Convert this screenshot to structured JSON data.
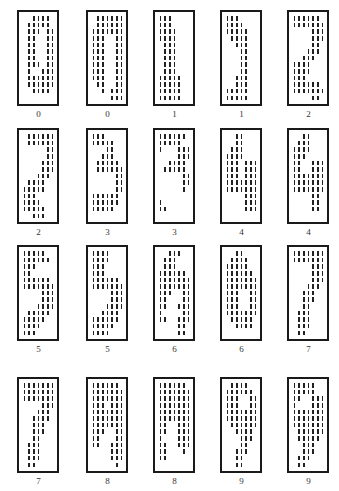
{
  "figure": {
    "grid_columns": 7,
    "grid_rows": 13,
    "samples": [
      {
        "label": "0",
        "bitmap": [
          "0011110",
          "0111110",
          "0111011",
          "0110011",
          "0110011",
          "0110011",
          "0110011",
          "0111011",
          "0100111",
          "0111111",
          "0111111",
          "0011110",
          "0000000"
        ]
      },
      {
        "label": "0",
        "bitmap": [
          "0111111",
          "0111111",
          "1111111",
          "1110011",
          "1110011",
          "1110011",
          "1110011",
          "1110011",
          "1110011",
          "1110011",
          "0110011",
          "0010111",
          "0000111"
        ]
      },
      {
        "label": "1",
        "bitmap": [
          "1110000",
          "1110000",
          "1111000",
          "1111000",
          "0111000",
          "0111000",
          "0111000",
          "0111000",
          "0111000",
          "1111100",
          "1111100",
          "1111100",
          "1111100"
        ]
      },
      {
        "label": "1",
        "bitmap": [
          "1110000",
          "1111000",
          "1111100",
          "0111100",
          "0011100",
          "0001100",
          "0001100",
          "0001100",
          "0001100",
          "0011100",
          "0011100",
          "1111100",
          "1111100"
        ]
      },
      {
        "label": "2",
        "bitmap": [
          "1111110",
          "1111111",
          "0000111",
          "0000111",
          "0000110",
          "0001110",
          "0011100",
          "1111000",
          "1111000",
          "1110000",
          "1111110",
          "1111111",
          "0000110"
        ]
      },
      {
        "label": "2",
        "bitmap": [
          "0111111",
          "0111111",
          "0000011",
          "0000011",
          "0000111",
          "0000111",
          "0001110",
          "0111100",
          "1111100",
          "1110000",
          "1111000",
          "1111100",
          "0011100"
        ]
      },
      {
        "label": "3",
        "bitmap": [
          "1110000",
          "1111100",
          "0001100",
          "0011100",
          "0111110",
          "0111111",
          "0000011",
          "0000011",
          "0000011",
          "1111110",
          "1111110",
          "1111100",
          "0000000"
        ]
      },
      {
        "label": "3",
        "bitmap": [
          "1111110",
          "1111100",
          "1000111",
          "0000111",
          "0011110",
          "0111110",
          "0000011",
          "0000011",
          "0000010",
          "0000000",
          "1000000",
          "1100000",
          "0000000"
        ]
      },
      {
        "label": "4",
        "bitmap": [
          "0011000",
          "0011000",
          "0111000",
          "1111000",
          "1110111",
          "1110111",
          "1110111",
          "1111111",
          "1111111",
          "0000111",
          "0000111",
          "0000111",
          "0000000"
        ]
      },
      {
        "label": "4",
        "bitmap": [
          "0011000",
          "0111000",
          "1111000",
          "1110000",
          "1100111",
          "1100111",
          "1111111",
          "1111111",
          "1111111",
          "0000110",
          "0000110",
          "0000110",
          "0000000"
        ]
      },
      {
        "label": "5",
        "bitmap": [
          "1111100",
          "1111110",
          "1110000",
          "1100000",
          "1111110",
          "1111111",
          "0000111",
          "0000111",
          "0001111",
          "0111110",
          "1111100",
          "1111000",
          "1110000"
        ]
      },
      {
        "label": "5",
        "bitmap": [
          "1111000",
          "1111000",
          "1110000",
          "1110000",
          "1111110",
          "1111111",
          "0000111",
          "0000111",
          "0001111",
          "0011110",
          "1111110",
          "1111100",
          "1111000"
        ]
      },
      {
        "label": "6",
        "bitmap": [
          "0011100",
          "0111000",
          "0111000",
          "1111110",
          "1111111",
          "1111111",
          "1110011",
          "1100011",
          "1100111",
          "1000011",
          "1100111",
          "0000110",
          "0000110"
        ]
      },
      {
        "label": "6",
        "bitmap": [
          "0011000",
          "0111100",
          "1111100",
          "1111110",
          "1111111",
          "1111111",
          "1110011",
          "1110011",
          "1110011",
          "1111111",
          "0111110",
          "0011110",
          "0000000"
        ]
      },
      {
        "label": "7",
        "bitmap": [
          "1111111",
          "1111111",
          "0000111",
          "0000111",
          "0000111",
          "0001110",
          "0011100",
          "0011100",
          "0011000",
          "0111000",
          "0111000",
          "0111000",
          "0110000"
        ]
      },
      {
        "label": "7",
        "bitmap": [
          "1111111",
          "1111111",
          "1111111",
          "0000111",
          "0001110",
          "0011110",
          "0011100",
          "0011100",
          "0011000",
          "0111000",
          "0111000",
          "0111000",
          "0110000"
        ]
      },
      {
        "label": "8",
        "bitmap": [
          "1111110",
          "1111111",
          "1111111",
          "1110111",
          "1111111",
          "1111111",
          "1111111",
          "1110011",
          "1100011",
          "1100111",
          "0000111",
          "0000111",
          "0000010"
        ]
      },
      {
        "label": "8",
        "bitmap": [
          "1111110",
          "1111111",
          "1111111",
          "1111111",
          "1111111",
          "1111111",
          "1100111",
          "1100111",
          "1000111",
          "1100111",
          "1100010",
          "1100000",
          "0000000"
        ]
      },
      {
        "label": "9",
        "bitmap": [
          "0111100",
          "1111110",
          "1110011",
          "1110011",
          "1111111",
          "1111111",
          "0111111",
          "0011110",
          "0001110",
          "0001100",
          "0011100",
          "0011000",
          "0011000"
        ]
      },
      {
        "label": "9",
        "bitmap": [
          "1111100",
          "1111100",
          "1100111",
          "1000111",
          "1111111",
          "1111111",
          "1111111",
          "0111111",
          "0111110",
          "0011100",
          "0011100",
          "0111000",
          "0110000"
        ]
      }
    ]
  }
}
